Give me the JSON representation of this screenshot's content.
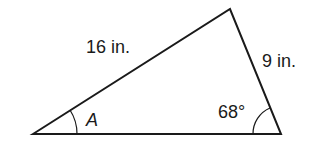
{
  "diagram": {
    "type": "triangle",
    "vertices": {
      "left": [
        33,
        134
      ],
      "top": [
        230,
        9
      ],
      "right": [
        281,
        134
      ]
    },
    "labels": {
      "side_left": "16 in.",
      "side_right": "9 in.",
      "angle_left": "A",
      "angle_right": "68°"
    },
    "stroke_color": "#1a1a1a"
  }
}
